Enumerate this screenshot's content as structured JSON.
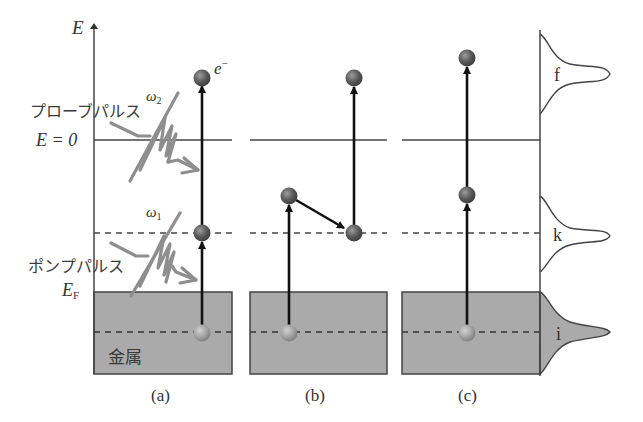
{
  "figure": {
    "axis": {
      "label": "E"
    },
    "levels": {
      "vacuum": "E = 0",
      "fermi_main": "E",
      "fermi_sub": "F"
    },
    "labels": {
      "electron": "e",
      "electron_sup": "−",
      "probe_pulse": "プローブパルス",
      "pump_pulse": "ポンプパルス",
      "omega2_main": "ω",
      "omega2_sub": "2",
      "omega1_main": "ω",
      "omega1_sub": "1",
      "metal": "金属"
    },
    "panels": [
      {
        "id": "a",
        "caption": "(a)"
      },
      {
        "id": "b",
        "caption": "(b)"
      },
      {
        "id": "c",
        "caption": "(c)"
      }
    ],
    "spectrum": {
      "peaks": [
        {
          "label": "f",
          "filled": false
        },
        {
          "label": "k",
          "filled": false
        },
        {
          "label": "i",
          "filled": true
        }
      ]
    },
    "colors": {
      "metal_fill": "#a9a9a9",
      "line": "#4a4a4a",
      "arrow": "#111111",
      "pulse": "#8c8c8c",
      "ball_dark": "#555555",
      "ball_light": "#9a9a9a"
    }
  }
}
